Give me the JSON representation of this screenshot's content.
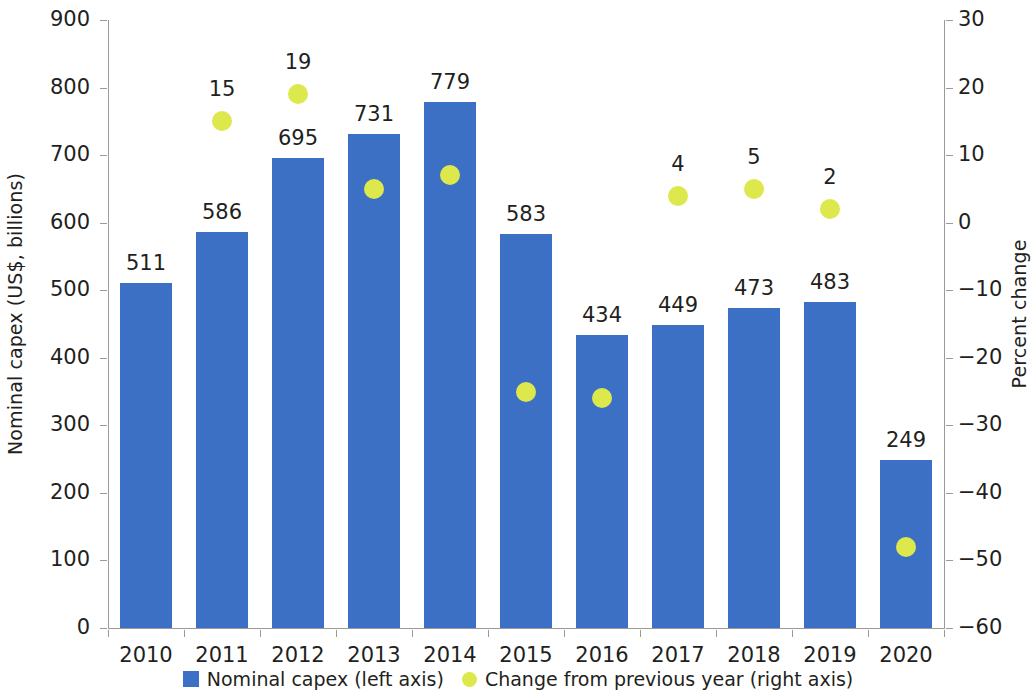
{
  "chart_data": {
    "type": "bar",
    "title": "",
    "subtitle": "",
    "xlabel": "",
    "ylabel": "Nominal capex (US$, billions)",
    "ylabel_right": "Percent change",
    "categories": [
      "2010",
      "2011",
      "2012",
      "2013",
      "2014",
      "2015",
      "2016",
      "2017",
      "2018",
      "2019",
      "2020"
    ],
    "ylim": [
      0,
      900
    ],
    "ylim_right": [
      -60,
      30
    ],
    "yticks": [
      900,
      800,
      700,
      600,
      500,
      400,
      300,
      200,
      100,
      0
    ],
    "yticks_right": [
      30,
      20,
      10,
      0,
      -10,
      -20,
      -30,
      -40,
      -50,
      -60
    ],
    "grid": false,
    "legend_position": "bottom",
    "series": [
      {
        "name": "Nominal capex (left axis)",
        "type": "bar",
        "axis": "left",
        "color": "#3b70c4",
        "values": [
          511,
          586,
          695,
          731,
          779,
          583,
          434,
          449,
          473,
          483,
          249
        ],
        "labels": [
          "511",
          "586",
          "695",
          "731",
          "779",
          "583",
          "434",
          "449",
          "473",
          "483",
          "249"
        ]
      },
      {
        "name": "Change from previous year (right axis)",
        "type": "scatter",
        "axis": "right",
        "color": "#dce84c",
        "values": [
          null,
          15,
          19,
          5,
          7,
          -25,
          -26,
          4,
          5,
          2,
          -48
        ],
        "labels": [
          "",
          "15",
          "19",
          "",
          "",
          "",
          "",
          "4",
          "5",
          "2",
          ""
        ]
      }
    ]
  },
  "legend": {
    "items": [
      {
        "label": "Nominal capex (left axis)",
        "marker": "square",
        "color": "#3b70c4"
      },
      {
        "label": "Change from previous year (right axis)",
        "marker": "circle",
        "color": "#dce84c"
      }
    ]
  }
}
